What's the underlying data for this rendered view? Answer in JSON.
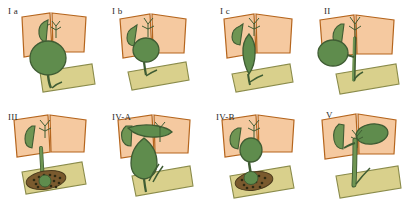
{
  "figure": {
    "name": "todani-classification-choledochal-cysts",
    "background_color": "#ffffff",
    "width": 408,
    "height": 213,
    "columns": 4,
    "rows": 2
  },
  "palette": {
    "liver": "#f5c9a0",
    "liver_outline": "#b5651d",
    "duct_green": "#6f9553",
    "cyst_green": "#5f8c4d",
    "cyst_dark": "#4d7540",
    "green_outline": "#3f5c33",
    "duodenum": "#d9d08c",
    "duodenum_outline": "#8a8b4a",
    "pancreas_fill": "#7a5a2e",
    "pancreas_speck": "#2e2a12",
    "label_color": "#2b2b28"
  },
  "panels": [
    {
      "id": "panel-1a",
      "label": "I a",
      "label_x": 8,
      "label_y": 7,
      "type": "cystic-dilatation-fusiform-large",
      "description": "Type I a - cystic dilatation of the entire common bile duct",
      "features": {
        "liver": true,
        "gallbladder": true,
        "duodenum": true,
        "pancreas_stipple": false,
        "cyst_shape": "large-round-choledochal",
        "intrahepatic_dilatation": false
      }
    },
    {
      "id": "panel-1b",
      "label": "I b",
      "label_x": 112,
      "label_y": 7,
      "type": "focal-segmental-dilatation",
      "description": "Type I b - focal segmental dilatation of the common bile duct",
      "features": {
        "liver": true,
        "gallbladder": true,
        "duodenum": true,
        "pancreas_stipple": false,
        "cyst_shape": "segmental-oval",
        "intrahepatic_dilatation": false
      }
    },
    {
      "id": "panel-1c",
      "label": "I c",
      "label_x": 220,
      "label_y": 7,
      "type": "fusiform-dilatation",
      "description": "Type I c - fusiform dilatation of the common bile duct",
      "features": {
        "liver": true,
        "gallbladder": true,
        "duodenum": true,
        "pancreas_stipple": false,
        "cyst_shape": "fusiform-narrow",
        "intrahepatic_dilatation": false
      }
    },
    {
      "id": "panel-2",
      "label": "II",
      "label_x": 324,
      "label_y": 7,
      "type": "diverticulum",
      "description": "Type II - true diverticulum of the extrahepatic bile duct",
      "features": {
        "liver": true,
        "gallbladder": true,
        "duodenum": true,
        "pancreas_stipple": false,
        "cyst_shape": "lateral-diverticulum",
        "intrahepatic_dilatation": false
      }
    },
    {
      "id": "panel-3",
      "label": "III",
      "label_x": 8,
      "label_y": 113,
      "type": "choledochocele",
      "description": "Type III - choledochocele, dilatation of the intraduodenal portion",
      "features": {
        "liver": true,
        "gallbladder": true,
        "duodenum": true,
        "pancreas_stipple": true,
        "cyst_shape": "intraduodenal-choledochocele",
        "intrahepatic_dilatation": false
      }
    },
    {
      "id": "panel-4a",
      "label": "IV-A",
      "label_x": 112,
      "label_y": 113,
      "type": "multiple-intra-and-extrahepatic",
      "description": "Type IV-A - multiple dilatations of intrahepatic and extrahepatic bile ducts",
      "features": {
        "liver": true,
        "gallbladder": true,
        "duodenum": true,
        "pancreas_stipple": false,
        "cyst_shape": "large-extrahepatic-with-intrahepatic",
        "intrahepatic_dilatation": true
      }
    },
    {
      "id": "panel-4b",
      "label": "IV-B",
      "label_x": 216,
      "label_y": 113,
      "type": "multiple-extrahepatic-only",
      "description": "Type IV-B - multiple dilatations of the extrahepatic bile duct only",
      "features": {
        "liver": true,
        "gallbladder": true,
        "duodenum": true,
        "pancreas_stipple": true,
        "cyst_shape": "multiple-extrahepatic",
        "intrahepatic_dilatation": false
      }
    },
    {
      "id": "panel-5",
      "label": "V",
      "label_x": 326,
      "label_y": 111,
      "type": "caroli-disease",
      "description": "Type V - Caroli disease, intrahepatic bile duct dilatation only",
      "features": {
        "liver": true,
        "gallbladder": true,
        "duodenum": true,
        "pancreas_stipple": false,
        "cyst_shape": "intrahepatic-only",
        "intrahepatic_dilatation": true
      }
    }
  ]
}
